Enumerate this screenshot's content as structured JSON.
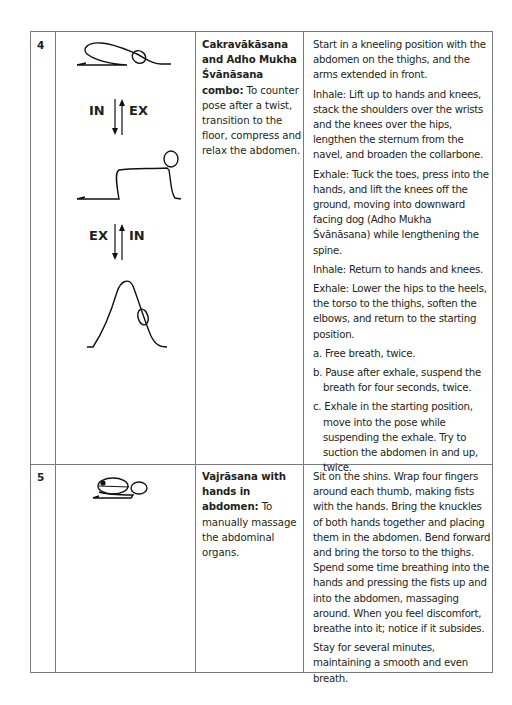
{
  "rows": [
    {
      "number": "4",
      "breath_labels": {
        "top_left": "IN",
        "top_right": "EX",
        "bottom_left": "EX",
        "bottom_right": "IN"
      },
      "name_bold": "Cakravākāsana and Adho Mukha Śvānāsana combo:",
      "name_rest": " To counter pose after a twist, transition to the floor, compress and relax the abdomen.",
      "instructions": [
        "Start in a kneeling position with the abdomen on the thighs, and the arms extended in front.",
        "Inhale: Lift up to hands and knees, stack the shoulders over the wrists and the knees over the hips, lengthen the sternum from the navel, and broaden the collarbone.",
        "Exhale: Tuck the toes, press into the hands, and lift the knees off the ground, moving into downward facing dog (Adho Mukha Śvānāsana) while lengthening the spine.",
        "Inhale: Return to hands and knees.",
        "Exhale: Lower the hips to the heels, the torso to the thighs, soften the elbows, and return to the starting position."
      ],
      "options": [
        "a. Free breath, twice.",
        "b. Pause after exhale, suspend the breath for four seconds, twice.",
        "c. Exhale in the starting position, move into the pose while suspending the exhale. Try to suction the abdomen in and up, twice."
      ]
    },
    {
      "number": "5",
      "name_bold": "Vajrāsana with hands in abdomen:",
      "name_rest": " To manually massage the abdominal organs.",
      "instructions": [
        "Sit on the shins. Wrap four fingers around each thumb, making fists with the hands. Bring the knuckles of both hands together and placing them in the abdomen. Bend forward and bring the torso to the thighs. Spend some time breathing into the hands and pressing the fists up and into the abdomen, massaging around. When you feel discomfort, breathe into it; notice if it subsides.",
        "Stay for several minutes, maintaining a smooth and even breath."
      ]
    }
  ]
}
